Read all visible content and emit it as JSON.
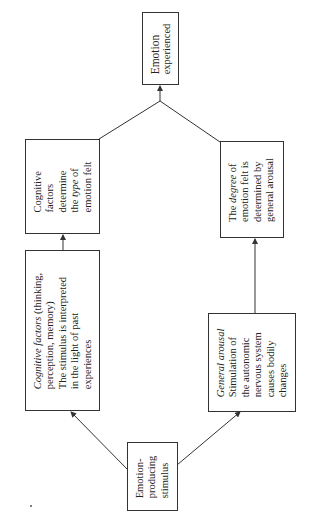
{
  "diagram": {
    "type": "flowchart",
    "orientation": "rotated -90deg (reads bottom-to-top)",
    "nodes": {
      "outcome": {
        "lines": [
          "Emotion",
          "experienced"
        ]
      },
      "type_box": {
        "lines": [
          {
            "pre": "Cognitive",
            "em": "",
            "post": ""
          },
          {
            "pre": "factors",
            "em": "",
            "post": ""
          },
          {
            "pre": "determine",
            "em": "",
            "post": ""
          },
          {
            "pre": "the ",
            "em": "type",
            "post": " of"
          },
          {
            "pre": "emotion felt",
            "em": "",
            "post": ""
          }
        ]
      },
      "degree_box": {
        "lines": [
          {
            "pre": "The ",
            "em": "degree",
            "post": " of"
          },
          {
            "pre": "emotion felt is",
            "em": "",
            "post": ""
          },
          {
            "pre": "determined by",
            "em": "",
            "post": ""
          },
          {
            "pre": "general arousal",
            "em": "",
            "post": ""
          }
        ]
      },
      "cognitive_box": {
        "lines": [
          {
            "pre": "",
            "em": "Cognitive factors",
            "post": " (thinking,"
          },
          {
            "pre": "perception, memory)",
            "em": "",
            "post": ""
          },
          {
            "pre": "The stimulus is interpreted",
            "em": "",
            "post": ""
          },
          {
            "pre": "in the light of past",
            "em": "",
            "post": ""
          },
          {
            "pre": "experiences",
            "em": "",
            "post": ""
          }
        ]
      },
      "arousal_box": {
        "lines": [
          {
            "pre": "",
            "em": "General arousal",
            "post": ""
          },
          {
            "pre": "Stimulation of",
            "em": "",
            "post": ""
          },
          {
            "pre": "the autonomic",
            "em": "",
            "post": ""
          },
          {
            "pre": "nervous system",
            "em": "",
            "post": ""
          },
          {
            "pre": "causes bodily",
            "em": "",
            "post": ""
          },
          {
            "pre": "changes",
            "em": "",
            "post": ""
          }
        ]
      },
      "stimulus": {
        "lines": [
          "Emotion-",
          "producing",
          "stimulus"
        ]
      }
    },
    "edges": [
      {
        "from": "stimulus",
        "to": "cognitive_box"
      },
      {
        "from": "stimulus",
        "to": "arousal_box"
      },
      {
        "from": "cognitive_box",
        "to": "type_box"
      },
      {
        "from": "arousal_box",
        "to": "degree_box"
      },
      {
        "from": "type_box",
        "to": "outcome",
        "via": "junction"
      },
      {
        "from": "degree_box",
        "to": "outcome",
        "via": "junction"
      }
    ],
    "colors": {
      "line": "#333333",
      "text": "#222222",
      "background": "#ffffff"
    }
  }
}
